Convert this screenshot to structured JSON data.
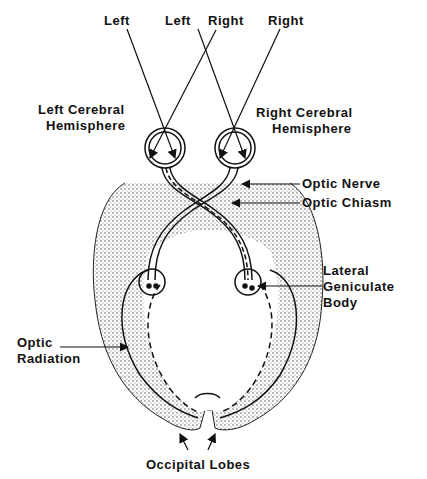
{
  "diagram": {
    "type": "visual pathway anatomy",
    "visual_fields": {
      "left_outer": "Left",
      "left_inner": "Left",
      "right_inner": "Right",
      "right_outer": "Right"
    },
    "labels": {
      "left_hemisphere_line1": "Left Cerebral",
      "left_hemisphere_line2": "Hemisphere",
      "right_hemisphere_line1": "Right Cerebral",
      "right_hemisphere_line2": "Hemisphere",
      "optic_nerve": "Optic Nerve",
      "optic_chiasm": "Optic Chiasm",
      "lgb_line1": "Lateral",
      "lgb_line2": "Geniculate",
      "lgb_line3": "Body",
      "optic_radiation_line1": "Optic",
      "optic_radiation_line2": "Radiation",
      "occipital_lobes": "Occipital Lobes"
    },
    "colors": {
      "ink": "#111111",
      "background": "#ffffff",
      "stipple": "#555555"
    }
  }
}
